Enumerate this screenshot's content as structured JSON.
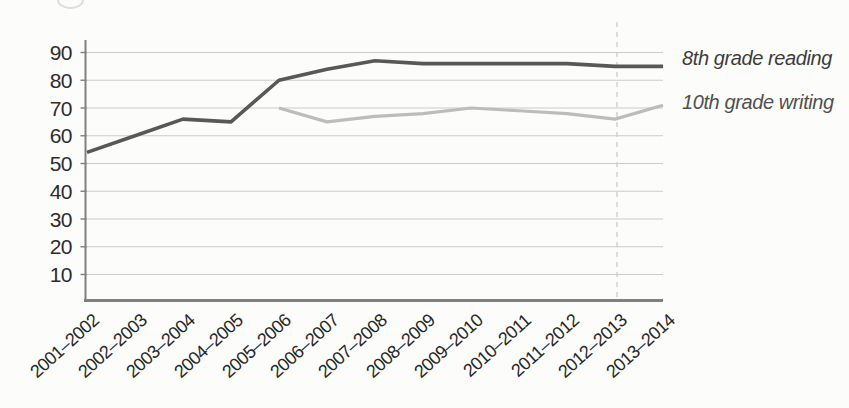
{
  "chart_data": {
    "type": "line",
    "title": "",
    "xlabel": "",
    "ylabel": "",
    "categories": [
      "2001–2002",
      "2002–2003",
      "2003–2004",
      "2004–2005",
      "2005–2006",
      "2006–2007",
      "2007–2008",
      "2008–2009",
      "2009–2010",
      "2010–2011",
      "2011–2012",
      "2012–2013",
      "2013–2014"
    ],
    "series": [
      {
        "name": "8th grade reading",
        "color": "#585858",
        "label_color": "#3c3c3c",
        "values": [
          54,
          60,
          66,
          65,
          80,
          84,
          87,
          86,
          86,
          86,
          86,
          85,
          85
        ]
      },
      {
        "name": "10th grade writing",
        "color": "#bcbcbc",
        "label_color": "#4f4f4f",
        "values": [
          null,
          null,
          null,
          null,
          70,
          65,
          67,
          68,
          70,
          69,
          68,
          66,
          71
        ]
      }
    ],
    "yticks": [
      10,
      20,
      30,
      40,
      50,
      60,
      70,
      80,
      90
    ],
    "ylim": [
      0,
      93
    ],
    "grid": true,
    "legend_position": "right-of-line-ends",
    "annotations": [
      {
        "type": "vline",
        "category": "2012–2013",
        "style": "dashed"
      }
    ],
    "colors": {
      "grid": "#cbcbcb",
      "axis": "#808080",
      "tick_label": "#2c2c2c",
      "background": "#fcfcfa"
    }
  }
}
